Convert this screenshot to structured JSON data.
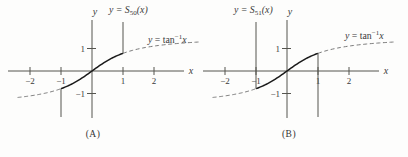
{
  "figure": {
    "colors": {
      "background": "#fdfdfc",
      "curve": "#1b1b1b",
      "dashed_curve": "#7a7a7a",
      "axis": "#55554f",
      "text": "#3a3a3a"
    }
  },
  "chart_data": [
    {
      "type": "line",
      "panel": "A",
      "caption": "(A)",
      "x_axis_label": "x",
      "y_axis_label": "y",
      "x_ticks": [
        -2,
        -1,
        1,
        2
      ],
      "y_ticks": [
        1,
        -1
      ],
      "series_label": {
        "y_var": "y = S",
        "sub": "50",
        "rest": "(x)"
      },
      "reference_label": {
        "y_var": "y",
        "eq": " = tan",
        "sup": "−1",
        "x_var": "x"
      },
      "series": [
        {
          "name": "partial-sum-S50",
          "fn": "atan",
          "style": "solid",
          "domain": [
            -1,
            1
          ]
        },
        {
          "name": "arctan-extension-left",
          "fn": "atan",
          "style": "dashed",
          "domain": [
            -2.4,
            -1
          ]
        },
        {
          "name": "arctan-extension-right",
          "fn": "atan",
          "style": "dashed",
          "domain": [
            1,
            3.5
          ]
        }
      ],
      "divergence_spikes": [
        {
          "x": 1,
          "direction": "up"
        },
        {
          "x": -1,
          "direction": "down"
        }
      ]
    },
    {
      "type": "line",
      "panel": "B",
      "caption": "(B)",
      "x_axis_label": "x",
      "y_axis_label": "y",
      "x_ticks": [
        -2,
        -1,
        1,
        2
      ],
      "y_ticks": [
        1,
        -1
      ],
      "series_label": {
        "y_var": "y = S",
        "sub": "51",
        "rest": "(x)"
      },
      "reference_label": {
        "y_var": "y",
        "eq": " = tan",
        "sup": "−1",
        "x_var": "x"
      },
      "series": [
        {
          "name": "partial-sum-S51",
          "fn": "atan",
          "style": "solid",
          "domain": [
            -1,
            1
          ]
        },
        {
          "name": "arctan-extension-left",
          "fn": "atan",
          "style": "dashed",
          "domain": [
            -2.4,
            -1
          ]
        },
        {
          "name": "arctan-extension-right",
          "fn": "atan",
          "style": "dashed",
          "domain": [
            1,
            3.5
          ]
        }
      ],
      "divergence_spikes": [
        {
          "x": -1,
          "direction": "up"
        },
        {
          "x": 1,
          "direction": "down"
        }
      ]
    }
  ]
}
